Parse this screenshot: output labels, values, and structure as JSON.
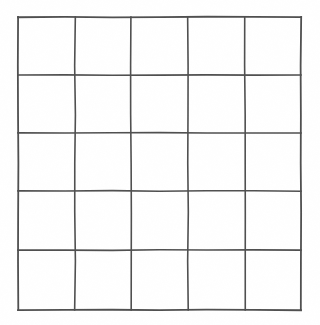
{
  "document": {
    "type": "blank-grid",
    "title": "Blank 5 by 5 grid",
    "background_color": "#ffffff",
    "line_color": "#4f4f4f",
    "line_width_px": 1.6,
    "has_text": false,
    "has_labels": false
  },
  "grid": {
    "rows": 5,
    "columns": 5,
    "cell_count": 25,
    "bounds": {
      "left_px": 18,
      "top_px": 16,
      "right_px": 302,
      "bottom_px": 311,
      "width_px": 284,
      "height_px": 295
    },
    "cell_width_px": 56.8,
    "cell_height_px": 59,
    "vertical_line_x": [
      18,
      75,
      131,
      188,
      245,
      301
    ],
    "horizontal_line_y": [
      17,
      75,
      133,
      191,
      250,
      310
    ],
    "cells": [
      [
        {
          "row": 1,
          "col": 1,
          "value": ""
        },
        {
          "row": 1,
          "col": 2,
          "value": ""
        },
        {
          "row": 1,
          "col": 3,
          "value": ""
        },
        {
          "row": 1,
          "col": 4,
          "value": ""
        },
        {
          "row": 1,
          "col": 5,
          "value": ""
        }
      ],
      [
        {
          "row": 2,
          "col": 1,
          "value": ""
        },
        {
          "row": 2,
          "col": 2,
          "value": ""
        },
        {
          "row": 2,
          "col": 3,
          "value": ""
        },
        {
          "row": 2,
          "col": 4,
          "value": ""
        },
        {
          "row": 2,
          "col": 5,
          "value": ""
        }
      ],
      [
        {
          "row": 3,
          "col": 1,
          "value": ""
        },
        {
          "row": 3,
          "col": 2,
          "value": ""
        },
        {
          "row": 3,
          "col": 3,
          "value": ""
        },
        {
          "row": 3,
          "col": 4,
          "value": ""
        },
        {
          "row": 3,
          "col": 5,
          "value": ""
        }
      ],
      [
        {
          "row": 4,
          "col": 1,
          "value": ""
        },
        {
          "row": 4,
          "col": 2,
          "value": ""
        },
        {
          "row": 4,
          "col": 3,
          "value": ""
        },
        {
          "row": 4,
          "col": 4,
          "value": ""
        },
        {
          "row": 4,
          "col": 5,
          "value": ""
        }
      ],
      [
        {
          "row": 5,
          "col": 1,
          "value": ""
        },
        {
          "row": 5,
          "col": 2,
          "value": ""
        },
        {
          "row": 5,
          "col": 3,
          "value": ""
        },
        {
          "row": 5,
          "col": 4,
          "value": ""
        },
        {
          "row": 5,
          "col": 5,
          "value": ""
        }
      ]
    ]
  }
}
